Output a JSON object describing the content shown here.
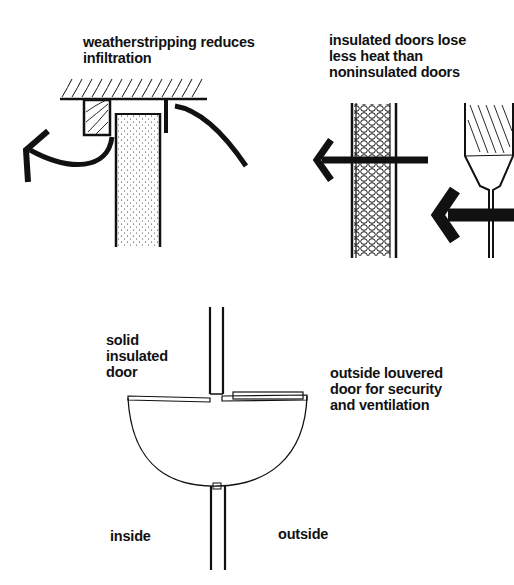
{
  "diagram": {
    "panels": [
      {
        "id": "weatherstripping",
        "caption": "weatherstripping reduces\ninfiltration"
      },
      {
        "id": "insulated-doors",
        "caption": "insulated doors lose\nless heat than\nnoninsulated doors"
      },
      {
        "id": "door-plan",
        "labels": {
          "solid_door": "solid\ninsulated\ndoor",
          "louvered_door": "outside louvered\ndoor for security\nand ventilation",
          "inside": "inside",
          "outside": "outside"
        }
      }
    ],
    "colors": {
      "ink": "#111111",
      "paper": "#ffffff"
    }
  }
}
